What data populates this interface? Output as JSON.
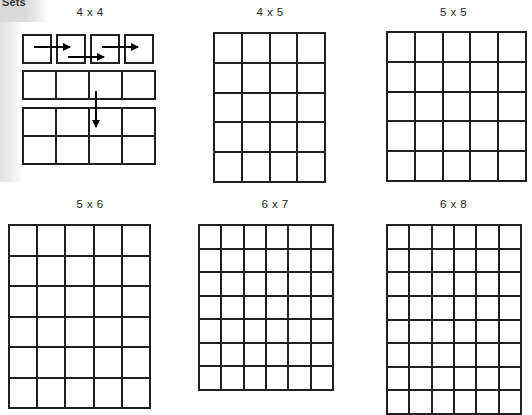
{
  "page": {
    "background_color": "#ffffff",
    "ink_color": "#231f20",
    "edge_strip_color": "#d8d8d8",
    "corner_label": "Sets"
  },
  "figures": [
    {
      "id": "fig-4x4",
      "title": "4 x 4",
      "columns": 4,
      "rows": 4,
      "style": "exploded-with-arrows",
      "description": "Four separated unit squares on the top row, a joined strip of four cells, then a joined block of four by two cells, annotated with three horizontal arrows and one vertical arrow.",
      "arrows": [
        {
          "name": "arrow-right-1",
          "direction": "right"
        },
        {
          "name": "arrow-right-2",
          "direction": "right"
        },
        {
          "name": "arrow-right-3",
          "direction": "right"
        },
        {
          "name": "arrow-down-1",
          "direction": "down"
        }
      ]
    },
    {
      "id": "fig-4x5",
      "title": "4 x 5",
      "columns": 4,
      "rows": 5,
      "style": "plain-grid"
    },
    {
      "id": "fig-5x5",
      "title": "5 x 5",
      "columns": 5,
      "rows": 5,
      "style": "plain-grid"
    },
    {
      "id": "fig-5x6",
      "title": "5 x 6",
      "columns": 5,
      "rows": 6,
      "style": "plain-grid"
    },
    {
      "id": "fig-6x7",
      "title": "6 x 7",
      "columns": 6,
      "rows": 7,
      "style": "plain-grid"
    },
    {
      "id": "fig-6x8",
      "title": "6 x 8",
      "columns": 6,
      "rows": 8,
      "style": "plain-grid-clipped"
    }
  ]
}
